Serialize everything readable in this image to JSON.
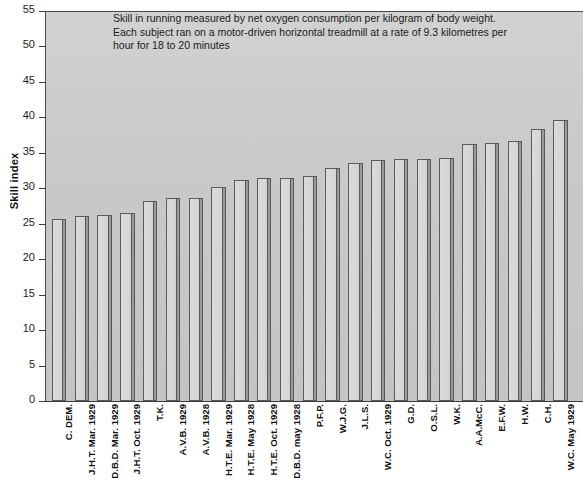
{
  "chart_data": {
    "type": "bar",
    "title": "",
    "caption": "Skill in running measured by net oxygen consumption per kilogram of body weight. Each subject ran on a motor-driven horizontal treadmill at a rate of 9.3 kilometres per hour for 18 to 20 minutes",
    "xlabel": "",
    "ylabel": "Skill index",
    "ylim": [
      0,
      55
    ],
    "yticks": [
      0,
      5,
      10,
      15,
      20,
      25,
      30,
      35,
      40,
      45,
      50,
      55
    ],
    "grid": false,
    "legend": null,
    "categories": [
      "C. DEM.",
      "J.H.T. Mar. 1929",
      "D.B.D. Mar. 1929",
      "J.H.T. Oct. 1929",
      "T.K.",
      "A.V.B. 1929",
      "A.V.B. 1928",
      "H.T.E. Mar. 1929",
      "H.T.E. May 1928",
      "H.T.E. Oct. 1929",
      "D.B.D. may 1928",
      "P.F.P.",
      "W.J.G.",
      "J.L.S.",
      "W.C. Oct. 1929",
      "G.D.",
      "O.S.L.",
      "W.K.",
      "A.A.McC.",
      "E.F.W.",
      "H.W.",
      "C.H.",
      "W.C. May 1929"
    ],
    "values": [
      25.6,
      26.1,
      26.3,
      26.5,
      28.2,
      28.6,
      28.7,
      30.2,
      31.2,
      31.4,
      31.5,
      31.8,
      32.9,
      33.5,
      34.0,
      34.1,
      34.2,
      34.3,
      36.2,
      36.4,
      36.7,
      38.3,
      39.7
    ]
  },
  "caption_lines": [
    "Skill in running measured by net oxygen consumption per kilogram of body weight.",
    "Each subject ran on a motor-driven horizontal treadmill at a rate of 9.3 kilometres per",
    "hour for 18 to 20 minutes"
  ]
}
